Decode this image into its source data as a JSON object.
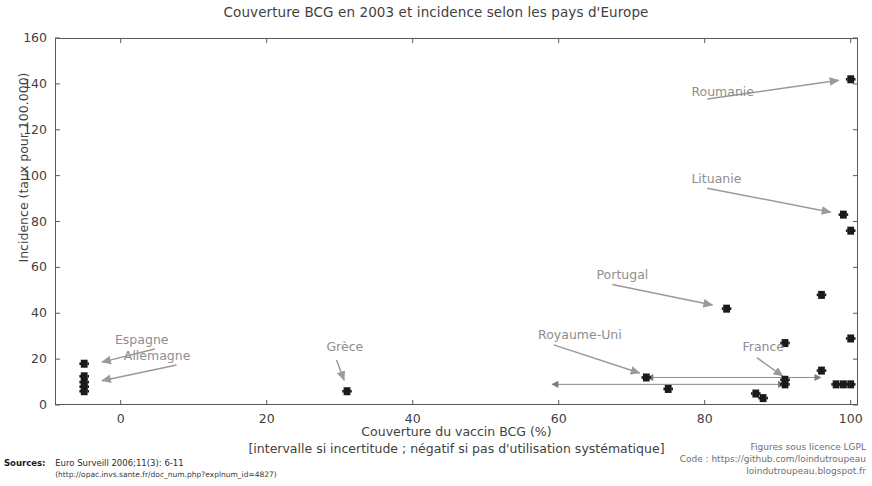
{
  "chart_data": {
    "type": "scatter",
    "title": "Couverture BCG en 2003 et incidence selon les pays d'Europe",
    "xlabel": "Couverture du vaccin BCG (%)",
    "xlabel_sub": "[intervalle si incertitude ; négatif si pas d'utilisation systématique]",
    "ylabel": "Incidence (taux pour 100.000)",
    "xlim": [
      -9,
      101
    ],
    "ylim": [
      0,
      160
    ],
    "xticks": [
      0,
      20,
      40,
      60,
      80,
      100
    ],
    "yticks": [
      0,
      20,
      40,
      60,
      80,
      100,
      120,
      140,
      160
    ],
    "grid": false,
    "legend": "none",
    "marker_color": "#1a1a1a",
    "annotation_color": "#8e8e8e",
    "axis_color": "#5a5a5a",
    "points": [
      {
        "x": -5,
        "y": 18,
        "label": "Espagne"
      },
      {
        "x": -5,
        "y": 12.5,
        "label": ""
      },
      {
        "x": -5,
        "y": 10,
        "label": ""
      },
      {
        "x": -5,
        "y": 8,
        "label": "Allemagne"
      },
      {
        "x": -5,
        "y": 6,
        "label": ""
      },
      {
        "x": 31,
        "y": 6,
        "label": "Grèce"
      },
      {
        "x": 72,
        "y": 12,
        "label": ""
      },
      {
        "x": 75,
        "y": 7,
        "label": ""
      },
      {
        "x": 83,
        "y": 42,
        "label": "Portugal"
      },
      {
        "x": 87,
        "y": 5,
        "label": ""
      },
      {
        "x": 88,
        "y": 3,
        "label": ""
      },
      {
        "x": 91,
        "y": 27,
        "label": ""
      },
      {
        "x": 91,
        "y": 11,
        "label": ""
      },
      {
        "x": 91,
        "y": 9,
        "label": ""
      },
      {
        "x": 96,
        "y": 48,
        "label": ""
      },
      {
        "x": 96,
        "y": 15,
        "label": ""
      },
      {
        "x": 98,
        "y": 9,
        "label": ""
      },
      {
        "x": 99,
        "y": 9,
        "label": ""
      },
      {
        "x": 99,
        "y": 83,
        "label": "Lituanie"
      },
      {
        "x": 100,
        "y": 142,
        "label": "Roumanie"
      },
      {
        "x": 100,
        "y": 76,
        "label": ""
      },
      {
        "x": 100,
        "y": 29,
        "label": ""
      },
      {
        "x": 100,
        "y": 9,
        "label": ""
      }
    ],
    "intervals": [
      {
        "x_start": 59,
        "x_end": 91,
        "y": 9
      },
      {
        "x_start": 72,
        "x_end": 96,
        "y": 12
      }
    ],
    "annotations": [
      {
        "text": "Roumanie",
        "x_label": 79,
        "y_label": 133,
        "x_point": 99.3,
        "y_point": 142
      },
      {
        "text": "Lituanie",
        "x_label": 79,
        "y_label": 95,
        "x_point": 98.2,
        "y_point": 83.5
      },
      {
        "text": "Portugal",
        "x_label": 66,
        "y_label": 53,
        "x_point": 82,
        "y_point": 43
      },
      {
        "text": "Royaume-Uni",
        "x_label": 58,
        "y_label": 27,
        "x_point": 72,
        "y_point": 13
      },
      {
        "text": "France",
        "x_label": 86,
        "y_label": 22,
        "x_point": 91.5,
        "y_point": 11
      },
      {
        "text": "Grèce",
        "x_label": 29,
        "y_label": 22,
        "x_point": 31,
        "y_point": 8
      },
      {
        "text": "Espagne",
        "x_label": 6,
        "y_label": 25,
        "x_point": -3.5,
        "y_point": 18
      },
      {
        "text": "Allemagne",
        "x_label": 9,
        "y_label": 18,
        "x_point": -3.5,
        "y_point": 10
      }
    ]
  },
  "footer": {
    "sources_label": "Sources:",
    "sources_line1": "Euro Surveill 2006;11(3): 6-11",
    "sources_line2": "(http://opac.invs.sante.fr/doc_num.php?explnum_id=4827)",
    "credit_line1": "Figures sous licence LGPL",
    "credit_line2": "Code : https://github.com/loindutroupeau",
    "credit_line3": "loindutroupeau.blogspot.fr"
  }
}
